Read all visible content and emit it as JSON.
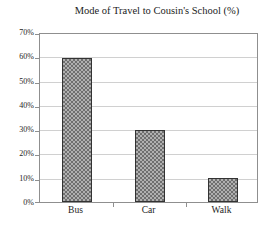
{
  "chart_data": {
    "type": "bar",
    "title": "Mode of Travel to Cousin's School (%)",
    "categories": [
      "Bus",
      "Car",
      "Walk"
    ],
    "values": [
      60,
      30,
      10
    ],
    "value_unit": "%",
    "xlabel": "",
    "ylabel": "",
    "ylim": [
      0,
      70
    ],
    "ytick_step": 10,
    "ytick_labels": [
      "0%",
      "10%",
      "20%",
      "30%",
      "40%",
      "50%",
      "60%",
      "70%"
    ],
    "grid": "horizontal",
    "legend": "none",
    "colors": {
      "background": "#ffffff",
      "text": "#1c1c1c",
      "axis": "#8f8f8f",
      "gridline": "#d0d0d0",
      "bar_fill_light": "#b0b0b0",
      "bar_fill_dark": "#6f6f6f",
      "bar_border": "#333333"
    }
  }
}
